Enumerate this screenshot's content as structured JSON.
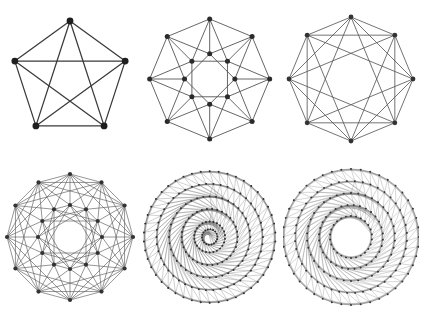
{
  "canvas": {
    "width": 421,
    "height": 316,
    "background": "#ffffff",
    "columns": 3,
    "rows": 2
  },
  "style": {
    "edge_color": "#4a4a4a",
    "vertex_color": "#262626",
    "default_edge_width": 0.8,
    "default_vertex_radius": 2.0
  },
  "figures": [
    {
      "name": "complete-graph-k5",
      "label": "K5",
      "cell_width": 140,
      "cell_height": 158,
      "center_x": 70,
      "center_y": 79,
      "edge_color": "#3a3a3a",
      "vertex_color": "#1e1e1e",
      "edge_width": 1.25,
      "vertex_radius": 3.4,
      "rings": [
        {
          "count": 5,
          "radius": 58,
          "phase": -90
        }
      ],
      "connections": [
        {
          "ring": 0,
          "steps": [
            1,
            2
          ]
        }
      ],
      "cross_links": []
    },
    {
      "name": "two-ring-octagonal-graph",
      "label": "8+8 double ring",
      "cell_width": 145,
      "cell_height": 158,
      "center_x": 72,
      "center_y": 79,
      "edge_color": "#4f4f4f",
      "vertex_color": "#2b2b2b",
      "edge_width": 0.9,
      "vertex_radius": 2.6,
      "rings": [
        {
          "count": 8,
          "radius": 62,
          "phase": -90
        },
        {
          "count": 8,
          "radius": 26,
          "phase": -90
        }
      ],
      "connections": [
        {
          "ring": 0,
          "steps": [
            1
          ]
        },
        {
          "ring": 1,
          "steps": [
            2
          ]
        }
      ],
      "cross_links": [
        {
          "from_ring": 0,
          "to_ring": 1,
          "offsets": [
            0,
            1,
            -1
          ]
        }
      ]
    },
    {
      "name": "circulant-graph-8",
      "label": "Circulant C8(1,2,3)",
      "cell_width": 136,
      "cell_height": 158,
      "center_x": 68,
      "center_y": 79,
      "edge_color": "#5a5a5a",
      "vertex_color": "#333333",
      "edge_width": 0.85,
      "vertex_radius": 2.4,
      "rings": [
        {
          "count": 8,
          "radius": 62,
          "phase": -90
        }
      ],
      "connections": [
        {
          "ring": 0,
          "steps": [
            1,
            2,
            3
          ]
        }
      ],
      "cross_links": []
    },
    {
      "name": "two-ring-dodecagonal-graph",
      "label": "12+12 double ring",
      "cell_width": 140,
      "cell_height": 158,
      "center_x": 70,
      "center_y": 79,
      "edge_color": "#5c5c5c",
      "vertex_color": "#333333",
      "edge_width": 0.65,
      "vertex_radius": 2.1,
      "rings": [
        {
          "count": 12,
          "radius": 63,
          "phase": -90
        },
        {
          "count": 12,
          "radius": 32,
          "phase": -90
        }
      ],
      "connections": [
        {
          "ring": 0,
          "steps": [
            1,
            2,
            3
          ]
        },
        {
          "ring": 1,
          "steps": [
            1,
            3,
            4
          ]
        }
      ],
      "cross_links": [
        {
          "from_ring": 0,
          "to_ring": 1,
          "offsets": [
            0,
            1,
            -1
          ]
        }
      ]
    },
    {
      "name": "dense-mandala-graph-small-hub",
      "label": "Dense multi-ring mandala",
      "cell_width": 145,
      "cell_height": 158,
      "center_x": 72,
      "center_y": 79,
      "edge_color": "#6b6b6b",
      "vertex_color": "#2e2e2e",
      "edge_width": 0.33,
      "vertex_radius": 1.0,
      "rings": [
        {
          "count": 46,
          "radius": 68,
          "phase": -90
        },
        {
          "count": 46,
          "radius": 55,
          "phase": -86
        },
        {
          "count": 40,
          "radius": 42,
          "phase": -90
        },
        {
          "count": 34,
          "radius": 29,
          "phase": -85
        },
        {
          "count": 26,
          "radius": 16,
          "phase": -90
        },
        {
          "count": 18,
          "radius": 8,
          "phase": -84
        }
      ],
      "connections": [
        {
          "ring": 0,
          "steps": [
            1,
            2,
            3
          ]
        },
        {
          "ring": 1,
          "steps": [
            1,
            2,
            3
          ]
        },
        {
          "ring": 2,
          "steps": [
            1,
            2,
            3
          ]
        },
        {
          "ring": 3,
          "steps": [
            1,
            2,
            3
          ]
        },
        {
          "ring": 4,
          "steps": [
            1,
            2
          ]
        },
        {
          "ring": 5,
          "steps": [
            1,
            2
          ]
        }
      ],
      "cross_links": [
        {
          "from_ring": 0,
          "to_ring": 1,
          "offsets": [
            0,
            1
          ]
        },
        {
          "from_ring": 1,
          "to_ring": 2,
          "offsets": [
            0,
            1
          ]
        },
        {
          "from_ring": 2,
          "to_ring": 3,
          "offsets": [
            0,
            1
          ]
        },
        {
          "from_ring": 3,
          "to_ring": 4,
          "offsets": [
            0,
            1
          ]
        },
        {
          "from_ring": 4,
          "to_ring": 5,
          "offsets": [
            0,
            1
          ]
        }
      ]
    },
    {
      "name": "dense-mandala-graph-open-hub",
      "label": "Dense multi-ring mandala with open centre",
      "cell_width": 136,
      "cell_height": 158,
      "center_x": 68,
      "center_y": 79,
      "edge_color": "#767676",
      "vertex_color": "#333333",
      "edge_width": 0.3,
      "vertex_radius": 0.95,
      "rings": [
        {
          "count": 44,
          "radius": 68,
          "phase": -90
        },
        {
          "count": 44,
          "radius": 56,
          "phase": -86
        },
        {
          "count": 38,
          "radius": 44,
          "phase": -90
        },
        {
          "count": 32,
          "radius": 32,
          "phase": -85
        },
        {
          "count": 26,
          "radius": 21,
          "phase": -90
        }
      ],
      "connections": [
        {
          "ring": 0,
          "steps": [
            1,
            2,
            3
          ]
        },
        {
          "ring": 1,
          "steps": [
            1,
            2,
            3
          ]
        },
        {
          "ring": 2,
          "steps": [
            1,
            2,
            3
          ]
        },
        {
          "ring": 3,
          "steps": [
            1,
            2,
            3
          ]
        },
        {
          "ring": 4,
          "steps": [
            1,
            2,
            3
          ]
        }
      ],
      "cross_links": [
        {
          "from_ring": 0,
          "to_ring": 1,
          "offsets": [
            0,
            1
          ]
        },
        {
          "from_ring": 1,
          "to_ring": 2,
          "offsets": [
            0,
            1
          ]
        },
        {
          "from_ring": 2,
          "to_ring": 3,
          "offsets": [
            0,
            1
          ]
        },
        {
          "from_ring": 3,
          "to_ring": 4,
          "offsets": [
            0,
            1
          ]
        }
      ]
    }
  ]
}
